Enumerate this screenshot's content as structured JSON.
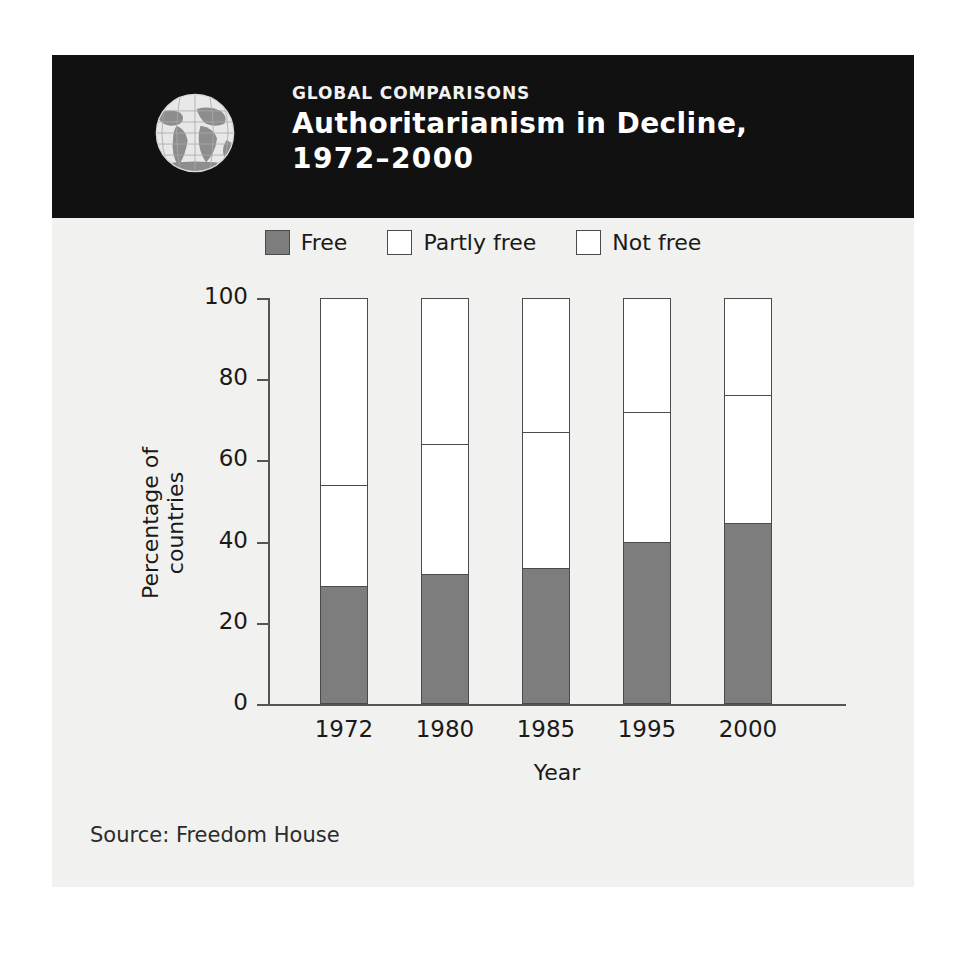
{
  "figure": {
    "header": {
      "eyebrow": "GLOBAL COMPARISONS",
      "title_line1": "Authoritarianism in Decline,",
      "title_line2": "1972–2000",
      "icon": "globe-icon",
      "background_color": "#111111",
      "text_color": "#ffffff"
    },
    "source_note": "Source: Freedom House",
    "background_color": "#f1f1ef"
  },
  "colors": {
    "free": "#7d7d7d",
    "partly_free": "#ffffff",
    "not_free": "#ffffff",
    "outline": "#4a4a4a",
    "axis": "#555555"
  },
  "chart_data": {
    "type": "bar",
    "stacked": true,
    "title": "Authoritarianism in Decline, 1972–2000",
    "xlabel": "Year",
    "ylabel": "Percentage of countries",
    "categories": [
      "1972",
      "1980",
      "1985",
      "1995",
      "2000"
    ],
    "ylim": [
      0,
      100
    ],
    "yticks": [
      0,
      20,
      40,
      60,
      80,
      100
    ],
    "ytick_labels": [
      "0",
      "20",
      "40",
      "60",
      "80",
      "100"
    ],
    "grid": false,
    "legend_position": "top-center",
    "series": [
      {
        "name": "Free",
        "swatch": "filled-gray",
        "color": "#7d7d7d",
        "values": [
          29,
          32,
          33.5,
          40,
          44.5
        ]
      },
      {
        "name": "Partly free",
        "swatch": "outline-white",
        "color": "#ffffff",
        "values": [
          25,
          32,
          33.5,
          32,
          31.5
        ]
      },
      {
        "name": "Not free",
        "swatch": "outline-white",
        "color": "#ffffff",
        "values": [
          46,
          36,
          33,
          28,
          24
        ]
      }
    ],
    "cumulative_tops": {
      "free": [
        29,
        32,
        33.5,
        40,
        44.5
      ],
      "partly_free": [
        54,
        64,
        67,
        72,
        76
      ],
      "not_free": [
        100,
        100,
        100,
        100,
        100
      ]
    }
  }
}
